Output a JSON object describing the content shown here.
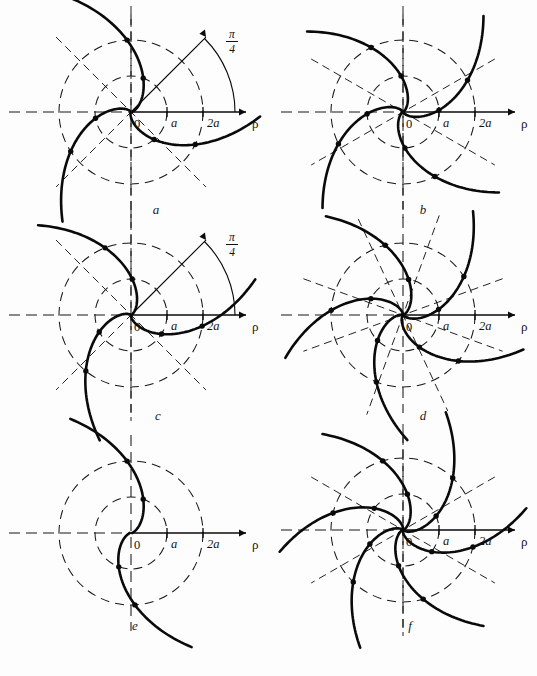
{
  "figure": {
    "background_color": "#fdfdfd",
    "ink_color": "#0a0a0a",
    "guide_color": "#171717",
    "width": 537,
    "height": 676,
    "axis_label": "ρ",
    "origin_label": "0",
    "tick_a": "a",
    "tick_2a": "2a",
    "angle_numerator": "π",
    "angle_denominator": "4"
  },
  "panels": [
    {
      "id": "a",
      "caption": "a",
      "caption_x": 146,
      "caption_y": 202,
      "cx": 131,
      "cy": 112,
      "r_a": 36,
      "r_2a": 72,
      "axis_left": -122,
      "axis_right": 115,
      "has_angle_mark": true,
      "angle_ray_length": 106,
      "angle_arc_radius": 104,
      "angle_label_x": 101,
      "angle_label_y": -74,
      "petals": 3,
      "petal_phase": 0,
      "guide_rays": [
        45,
        135,
        90
      ],
      "circles": [
        36,
        72
      ],
      "branch_kind": "hyperbolic-spiral-3",
      "branch_extent": 128,
      "dots_at": [
        36,
        72
      ]
    },
    {
      "id": "b",
      "caption": "b",
      "caption_x": 413,
      "caption_y": 202,
      "cx": 403,
      "cy": 112,
      "r_a": 36,
      "r_2a": 72,
      "axis_left": -122,
      "axis_right": 112,
      "has_angle_mark": false,
      "petals": 4,
      "petal_phase": 22,
      "guide_rays": [
        30,
        90,
        150
      ],
      "circles": [
        36,
        72
      ],
      "branch_kind": "hyperbolic-spiral-4",
      "branch_extent": 124,
      "dots_at": [
        36,
        72
      ]
    },
    {
      "id": "c",
      "caption": "c",
      "caption_x": 148,
      "caption_y": 408,
      "cx": 131,
      "cy": 315,
      "r_a": 36,
      "r_2a": 72,
      "axis_left": -122,
      "axis_right": 115,
      "has_angle_mark": true,
      "angle_ray_length": 106,
      "angle_arc_radius": 104,
      "angle_label_x": 101,
      "angle_label_y": -74,
      "petals": 3,
      "petal_phase": 18,
      "guide_rays": [
        45,
        135,
        90
      ],
      "circles": [
        36,
        72
      ],
      "branch_kind": "hyperbolic-spiral-3b",
      "branch_extent": 128,
      "dots_at": [
        36,
        72
      ]
    },
    {
      "id": "d",
      "caption": "d",
      "caption_x": 413,
      "caption_y": 408,
      "cx": 403,
      "cy": 315,
      "r_a": 36,
      "r_2a": 72,
      "axis_left": -122,
      "axis_right": 112,
      "has_angle_mark": false,
      "petals": 5,
      "petal_phase": 10,
      "guide_rays": [
        20,
        70,
        115,
        160
      ],
      "circles": [
        36,
        72
      ],
      "branch_kind": "hyperbolic-spiral-5",
      "branch_extent": 124,
      "dots_at": [
        36,
        72
      ]
    },
    {
      "id": "e",
      "caption": "e",
      "caption_x": 125,
      "caption_y": 618,
      "cx": 131,
      "cy": 533,
      "r_a": 36,
      "r_2a": 72,
      "axis_left": -122,
      "axis_right": 115,
      "has_angle_mark": false,
      "petals": 2,
      "petal_phase": 0,
      "guide_rays": [],
      "circles": [
        36,
        72
      ],
      "branch_kind": "hyperbolic-spiral-2",
      "branch_extent": 128,
      "dots_at": [
        36,
        72
      ]
    },
    {
      "id": "f",
      "caption": "f",
      "caption_x": 400,
      "caption_y": 618,
      "cx": 403,
      "cy": 530,
      "r_a": 36,
      "r_2a": 72,
      "axis_left": -122,
      "axis_right": 112,
      "has_angle_mark": false,
      "petals": 6,
      "petal_phase": 12,
      "guide_rays": [
        30,
        90,
        150
      ],
      "circles": [
        36,
        72
      ],
      "branch_kind": "hyperbolic-spiral-6",
      "branch_extent": 124,
      "dots_at": [
        36,
        72
      ]
    }
  ],
  "chart_data": {
    "type": "line",
    "title": "",
    "xlabel": "ρ",
    "ylabel": "",
    "x_ticks": [
      "0",
      "a",
      "2a"
    ],
    "x_tick_values": [
      0,
      1,
      2
    ],
    "reference_circles_radii": [
      1,
      2
    ],
    "angle_annotation": "π/4",
    "series": [
      {
        "name": "a",
        "branches": 3,
        "circles": [
          1,
          2
        ],
        "guide_rays_deg": [
          45,
          90,
          135
        ],
        "angle_marked_deg": 45
      },
      {
        "name": "b",
        "branches": 4,
        "circles": [
          1,
          2
        ],
        "guide_rays_deg": [
          30,
          90,
          150
        ],
        "angle_marked_deg": null
      },
      {
        "name": "c",
        "branches": 3,
        "circles": [
          1,
          2
        ],
        "guide_rays_deg": [
          45,
          90,
          135
        ],
        "angle_marked_deg": 45
      },
      {
        "name": "d",
        "branches": 5,
        "circles": [
          1,
          2
        ],
        "guide_rays_deg": [
          20,
          70,
          115,
          160
        ],
        "angle_marked_deg": null
      },
      {
        "name": "e",
        "branches": 2,
        "circles": [
          1,
          2
        ],
        "guide_rays_deg": [],
        "angle_marked_deg": null
      },
      {
        "name": "f",
        "branches": 6,
        "circles": [
          1,
          2
        ],
        "guide_rays_deg": [
          30,
          90,
          150
        ],
        "angle_marked_deg": null
      }
    ]
  }
}
